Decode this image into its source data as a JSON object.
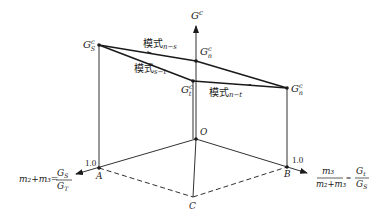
{
  "diagram": {
    "axis_vertical_label": "G",
    "axis_vertical_sup": "c",
    "points": {
      "Gs": {
        "base": "G",
        "sup": "c",
        "sub": "S"
      },
      "Gn_top": {
        "base": "G",
        "sup": "c",
        "sub": "n"
      },
      "Gt": {
        "base": "G",
        "sup": "c",
        "sub": "t"
      },
      "Gn_right": {
        "base": "G",
        "sup": "c",
        "sub": "n"
      },
      "O": "O",
      "A": "A",
      "B": "B",
      "C": "C"
    },
    "modes": {
      "n_s": {
        "text": "模式",
        "sub": "n−s"
      },
      "s_t": {
        "text": "模式",
        "sub": "s−t"
      },
      "n_t": {
        "text": "模式",
        "sub": "n−t"
      }
    },
    "tick_A": "1.0",
    "tick_B": "1.0",
    "left_axis": {
      "lhs": "m₂+m₃=",
      "num": "G",
      "num_sub": "S",
      "den": "G",
      "den_sub": "T"
    },
    "right_axis": {
      "frac1_num": "m₃",
      "frac1_den": "m₂+m₃",
      "eq": "=",
      "frac2_num": "G",
      "frac2_num_sub": "t",
      "frac2_den": "G",
      "frac2_den_sub": "S"
    }
  }
}
